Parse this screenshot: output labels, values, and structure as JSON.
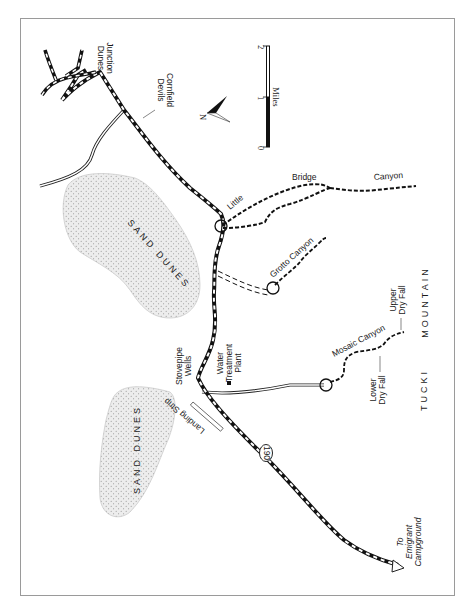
{
  "map": {
    "frame_color": "#9a9a9a",
    "road_color": "#111111",
    "dune_fill": "#e6e6e6",
    "dune_dot": "#9a9a9a",
    "labels": {
      "dunes_junction": [
        "Dunes",
        "Junction"
      ],
      "devils_cornfield": [
        "Devils",
        "Cornfield"
      ],
      "little": "Little",
      "bridge": "Bridge",
      "canyon": "Canyon",
      "sand_dunes_north": "SAND DUNES",
      "sand_dunes_south": "SAND DUNES",
      "grotto_canyon": "Grotto Canyon",
      "upper_dry_fall": [
        "Upper",
        "Dry Fall"
      ],
      "lower_dry_fall": [
        "Lower",
        "Dry Fall"
      ],
      "mosaic_canyon": "Mosaic Canyon",
      "mountain": "MOUNTAIN",
      "tucki": "TUCKI",
      "stovepipe_wells": [
        "Stovepipe",
        "Wells"
      ],
      "water_treatment_plant": [
        "Water",
        "Treatment",
        "Plant"
      ],
      "landing_strip": "Landing Strip",
      "highway_shield": "190",
      "emigrant": [
        "To",
        "Emigrant",
        "Campground"
      ]
    },
    "north_arrow": {
      "label": "N",
      "icon": "north-arrow-icon"
    },
    "scale_bar": {
      "unit": "Miles",
      "ticks": [
        "0",
        "1",
        "2"
      ]
    }
  }
}
